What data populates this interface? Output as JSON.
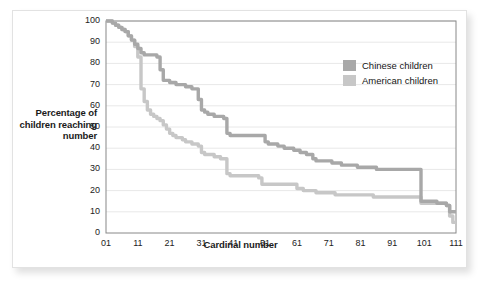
{
  "chart_data": {
    "type": "line",
    "title": "",
    "xlabel": "Cardinal number",
    "ylabel": "Percentage of children reaching number",
    "xlim": [
      1,
      111
    ],
    "ylim": [
      0,
      100
    ],
    "grid": true,
    "grid_axis": "y",
    "legend_position": "top-right",
    "xticks": [
      "01",
      "11",
      "21",
      "31",
      "41",
      "51",
      "61",
      "71",
      "81",
      "91",
      "101",
      "111"
    ],
    "xtick_values": [
      1,
      11,
      21,
      31,
      41,
      51,
      61,
      71,
      81,
      91,
      101,
      111
    ],
    "yticks": [
      "0",
      "10",
      "20",
      "30",
      "40",
      "50",
      "60",
      "70",
      "80",
      "90",
      "100"
    ],
    "ytick_values": [
      0,
      10,
      20,
      30,
      40,
      50,
      60,
      70,
      80,
      90,
      100
    ],
    "series": [
      {
        "name": "Chinese children",
        "color": "#a8a8a8",
        "x": [
          1,
          2,
          3,
          4,
          5,
          6,
          7,
          8,
          9,
          10,
          11,
          12,
          13,
          14,
          15,
          16,
          17,
          18,
          19,
          20,
          21,
          22,
          23,
          24,
          25,
          26,
          27,
          28,
          29,
          30,
          31,
          32,
          33,
          34,
          35,
          36,
          37,
          38,
          39,
          40,
          41,
          42,
          43,
          44,
          45,
          46,
          47,
          48,
          49,
          50,
          51,
          52,
          53,
          54,
          55,
          56,
          57,
          58,
          59,
          60,
          61,
          62,
          63,
          64,
          65,
          66,
          67,
          68,
          69,
          70,
          71,
          72,
          73,
          74,
          75,
          76,
          77,
          78,
          79,
          80,
          81,
          82,
          83,
          84,
          85,
          86,
          87,
          88,
          89,
          90,
          91,
          92,
          93,
          94,
          95,
          96,
          97,
          98,
          99,
          100,
          101,
          102,
          103,
          104,
          105,
          106,
          107,
          108,
          109,
          110,
          111
        ],
        "values": [
          100,
          100,
          99,
          98,
          97,
          96,
          95,
          93,
          91,
          89,
          87,
          85,
          84,
          84,
          84,
          84,
          83,
          77,
          72,
          72,
          71,
          71,
          70,
          70,
          70,
          69,
          69,
          68,
          68,
          63,
          58,
          57,
          56,
          56,
          55,
          55,
          55,
          54,
          47,
          46,
          46,
          46,
          46,
          46,
          46,
          46,
          46,
          46,
          46,
          46,
          43,
          42,
          42,
          42,
          41,
          41,
          40,
          40,
          40,
          39,
          39,
          38,
          38,
          37,
          37,
          35,
          34,
          34,
          34,
          34,
          34,
          33,
          33,
          33,
          32,
          32,
          32,
          32,
          32,
          31,
          31,
          31,
          31,
          31,
          31,
          30,
          30,
          30,
          30,
          30,
          30,
          30,
          30,
          30,
          30,
          30,
          30,
          30,
          30,
          15,
          15,
          15,
          15,
          15,
          14,
          14,
          14,
          13,
          10,
          10,
          10
        ]
      },
      {
        "name": "American children",
        "color": "#c7c7c7",
        "x": [
          1,
          2,
          3,
          4,
          5,
          6,
          7,
          8,
          9,
          10,
          11,
          12,
          13,
          14,
          15,
          16,
          17,
          18,
          19,
          20,
          21,
          22,
          23,
          24,
          25,
          26,
          27,
          28,
          29,
          30,
          31,
          32,
          33,
          34,
          35,
          36,
          37,
          38,
          39,
          40,
          41,
          42,
          43,
          44,
          45,
          46,
          47,
          48,
          49,
          50,
          51,
          52,
          53,
          54,
          55,
          56,
          57,
          58,
          59,
          60,
          61,
          62,
          63,
          64,
          65,
          66,
          67,
          68,
          69,
          70,
          71,
          72,
          73,
          74,
          75,
          76,
          77,
          78,
          79,
          80,
          81,
          82,
          83,
          84,
          85,
          86,
          87,
          88,
          89,
          90,
          91,
          92,
          93,
          94,
          95,
          96,
          97,
          98,
          99,
          100,
          101,
          102,
          103,
          104,
          105,
          106,
          107,
          108,
          109,
          110,
          111
        ],
        "values": [
          100,
          100,
          99,
          98,
          97,
          96,
          95,
          93,
          91,
          88,
          83,
          68,
          62,
          58,
          56,
          55,
          54,
          53,
          51,
          49,
          47,
          46,
          45,
          45,
          44,
          43,
          43,
          42,
          42,
          41,
          38,
          37,
          37,
          37,
          36,
          36,
          35,
          35,
          28,
          27,
          27,
          27,
          27,
          27,
          27,
          27,
          27,
          27,
          26,
          23,
          23,
          23,
          23,
          23,
          23,
          23,
          23,
          23,
          23,
          23,
          21,
          21,
          20,
          20,
          20,
          20,
          19,
          19,
          19,
          19,
          19,
          19,
          18,
          18,
          18,
          18,
          18,
          18,
          18,
          18,
          18,
          18,
          18,
          18,
          17,
          17,
          17,
          17,
          17,
          17,
          17,
          17,
          17,
          17,
          17,
          17,
          17,
          17,
          17,
          14,
          14,
          14,
          14,
          14,
          14,
          14,
          14,
          13,
          8,
          5,
          5
        ]
      }
    ]
  },
  "legend": {
    "items": [
      {
        "label": "Chinese children",
        "color": "#a8a8a8"
      },
      {
        "label": "American children",
        "color": "#c7c7c7"
      }
    ]
  },
  "colors": {
    "chinese": "#a8a8a8",
    "american": "#c7c7c7",
    "gridline": "#e8e8e8",
    "axis": "#888888",
    "text": "#1a1a1a"
  }
}
